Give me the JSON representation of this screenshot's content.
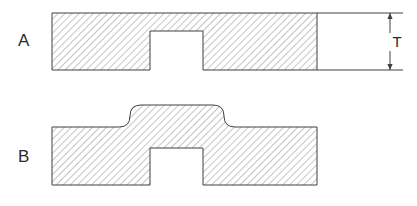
{
  "figure": {
    "background_color": "#ffffff",
    "line_color": "#404040",
    "hatch_color": "#8c8c8c",
    "text_color": "#2b2b2b"
  },
  "views": [
    {
      "id": "view-a",
      "label": "A",
      "description": "Plate of uniform thickness with a square rectangular notch cut in the underside",
      "label_x": 24,
      "label_y": 46,
      "geometry": {
        "left": 52,
        "right": 317,
        "top": 13,
        "bottom": 70,
        "notch_left": 150,
        "notch_right": 203,
        "notch_top": 31,
        "notch_bottom": 70,
        "corner_style": "sharp"
      }
    },
    {
      "id": "view-b",
      "label": "B",
      "description": "Plate with a raised boss blended by fillets above the rectangular notch",
      "label_x": 24,
      "label_y": 162,
      "geometry": {
        "left": 52,
        "right": 317,
        "base_top": 127,
        "bottom": 185,
        "boss_top": 105,
        "boss_left": 130,
        "boss_right": 224,
        "fillet_radius": 11,
        "notch_left": 150,
        "notch_right": 203,
        "notch_top": 148,
        "notch_bottom": 185,
        "corner_style": "filleted"
      }
    }
  ],
  "dimension": {
    "name": "thickness-dimension",
    "label": "T",
    "label_x": 397,
    "label_y": 47,
    "line_x": 390,
    "top_y": 13,
    "bottom_y": 70,
    "arrow_style": "outward",
    "extension_lines": [
      {
        "y": 13,
        "x1": 317,
        "x2": 403
      },
      {
        "y": 70,
        "x1": 317,
        "x2": 403
      }
    ]
  },
  "hatching": {
    "angle_deg": 45,
    "spacing_px": 5,
    "stroke_width": 1,
    "color": "#8c8c8c"
  }
}
